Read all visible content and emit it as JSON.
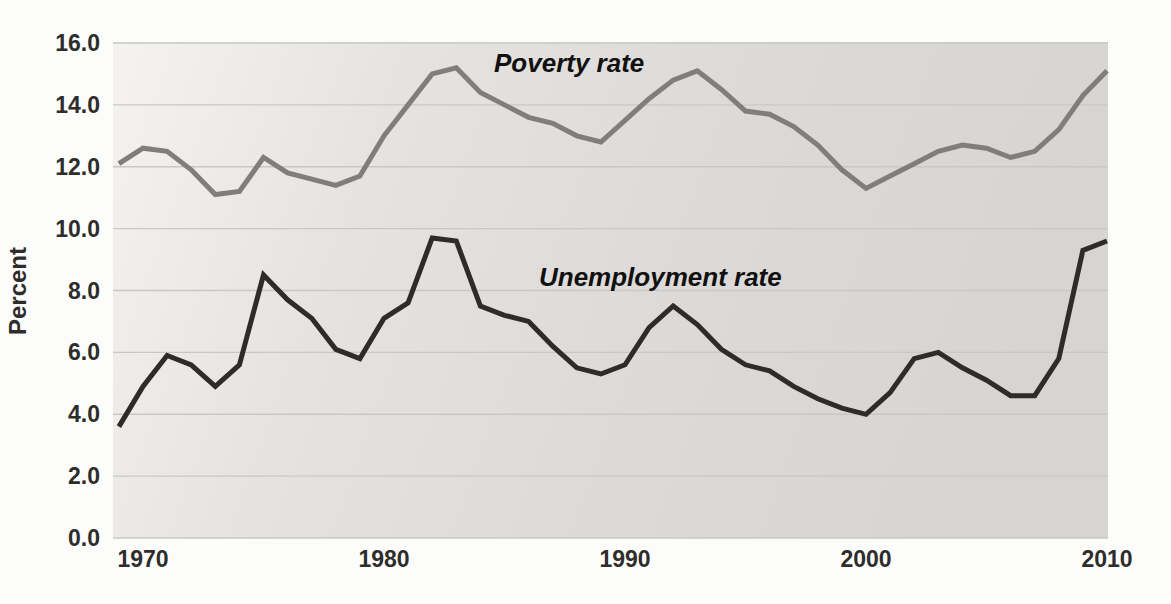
{
  "figure": {
    "kind": "photographed textbook line chart",
    "title": "",
    "background_color": "#fcfcfa"
  },
  "chart_data": {
    "type": "line",
    "title": "",
    "xlabel": "",
    "ylabel": "Percent",
    "ylim": [
      0,
      16
    ],
    "xlim": [
      1969,
      2010
    ],
    "grid": true,
    "grid_color": "#c9c8c6",
    "plot_bg_gradient": [
      "#f4f3f1",
      "#e4e3e1",
      "#dbdad8",
      "#d6d5d3"
    ],
    "yticks": [
      0.0,
      2.0,
      4.0,
      6.0,
      8.0,
      10.0,
      12.0,
      14.0,
      16.0
    ],
    "ytick_format": "one_decimal",
    "xticks": [
      1970,
      1980,
      1990,
      2000,
      2010
    ],
    "x": [
      1969,
      1970,
      1971,
      1972,
      1973,
      1974,
      1975,
      1976,
      1977,
      1978,
      1979,
      1980,
      1981,
      1982,
      1983,
      1984,
      1985,
      1986,
      1987,
      1988,
      1989,
      1990,
      1991,
      1992,
      1993,
      1994,
      1995,
      1996,
      1997,
      1998,
      1999,
      2000,
      2001,
      2002,
      2003,
      2004,
      2005,
      2006,
      2007,
      2008,
      2009,
      2010
    ],
    "series": [
      {
        "name": "Poverty rate",
        "color": "#807e7b",
        "line_width": 5,
        "values": [
          12.1,
          12.6,
          12.5,
          11.9,
          11.1,
          11.2,
          12.3,
          11.8,
          11.6,
          11.4,
          11.7,
          13.0,
          14.0,
          15.0,
          15.2,
          14.4,
          14.0,
          13.6,
          13.4,
          13.0,
          12.8,
          13.5,
          14.2,
          14.8,
          15.1,
          14.5,
          13.8,
          13.7,
          13.3,
          12.7,
          11.9,
          11.3,
          11.7,
          12.1,
          12.5,
          12.7,
          12.6,
          12.3,
          12.5,
          13.2,
          14.3,
          15.1
        ]
      },
      {
        "name": "Unemployment rate",
        "color": "#2d2c2a",
        "line_width": 5,
        "values": [
          3.6,
          4.9,
          5.9,
          5.6,
          4.9,
          5.6,
          8.5,
          7.7,
          7.1,
          6.1,
          5.8,
          7.1,
          7.6,
          9.7,
          9.6,
          7.5,
          7.2,
          7.0,
          6.2,
          5.5,
          5.3,
          5.6,
          6.8,
          7.5,
          6.9,
          6.1,
          5.6,
          5.4,
          4.9,
          4.5,
          4.2,
          4.0,
          4.7,
          5.8,
          6.0,
          5.5,
          5.1,
          4.6,
          4.6,
          5.8,
          9.3,
          9.6
        ]
      }
    ],
    "annotations": [
      {
        "text": "Poverty rate",
        "series": 0
      },
      {
        "text": "Unemployment rate",
        "series": 1
      }
    ],
    "legend_position": "inline-annotations"
  },
  "axis": {
    "tick_color": "#2e2d2b"
  }
}
